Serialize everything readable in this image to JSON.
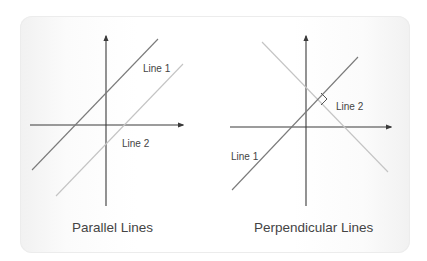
{
  "colors": {
    "axis": "#3a3a3a",
    "line_dark": "#7a7a7a",
    "line_light": "#c4c4c4",
    "text": "#444444"
  },
  "panels": [
    {
      "title": "Parallel Lines",
      "lines": [
        {
          "label": "Line 1",
          "style": "dark"
        },
        {
          "label": "Line 2",
          "style": "light"
        }
      ]
    },
    {
      "title": "Perpendicular Lines",
      "lines": [
        {
          "label": "Line 1",
          "style": "dark"
        },
        {
          "label": "Line 2",
          "style": "light"
        }
      ],
      "right_angle_marker": true
    }
  ]
}
